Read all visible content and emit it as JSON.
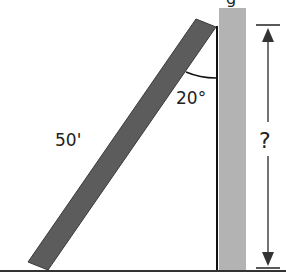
{
  "diagram": {
    "title_fragment": "g",
    "ladder": {
      "length_label": "50'",
      "color": "#5a5a5a"
    },
    "angle": {
      "label": "20°"
    },
    "wall": {
      "color": "#b3b3b3"
    },
    "height": {
      "label": "?"
    },
    "ground": {
      "color": "#333333"
    }
  }
}
